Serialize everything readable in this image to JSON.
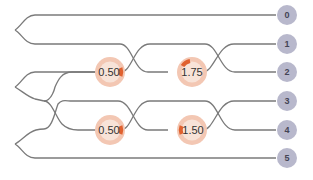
{
  "diagram": {
    "type": "photonic-circuit",
    "colors": {
      "wire": "#7a7a7a",
      "dial_outer": "#f3c7b3",
      "dial_inner": "#f8e3d8",
      "dial_arc": "#e0612f",
      "mode_circle": "#b8b8cc"
    },
    "modes": [
      {
        "label": "0",
        "y": 15
      },
      {
        "label": "1",
        "y": 44
      },
      {
        "label": "2",
        "y": 72
      },
      {
        "label": "3",
        "y": 101
      },
      {
        "label": "4",
        "y": 130
      },
      {
        "label": "5",
        "y": 158
      }
    ],
    "sources": [
      {
        "modes": [
          "0",
          "1"
        ]
      },
      {
        "modes": [
          "2",
          "3"
        ]
      },
      {
        "modes": [
          "4",
          "5"
        ]
      }
    ],
    "beamsplitters": [
      {
        "modes": [
          "2",
          "3"
        ],
        "x": 55
      },
      {
        "modes": [
          "1",
          "2"
        ],
        "x": 140
      },
      {
        "modes": [
          "3",
          "4"
        ],
        "x": 140
      },
      {
        "modes": [
          "1",
          "2"
        ],
        "x": 225
      },
      {
        "modes": [
          "3",
          "4"
        ],
        "x": 225
      }
    ],
    "phase_shifters": [
      {
        "mode": "2",
        "value": "0.50",
        "x": 110
      },
      {
        "mode": "2",
        "value": "1.75",
        "x": 192
      },
      {
        "mode": "4",
        "value": "0.50",
        "x": 110
      },
      {
        "mode": "4",
        "value": "1.50",
        "x": 192
      }
    ]
  }
}
